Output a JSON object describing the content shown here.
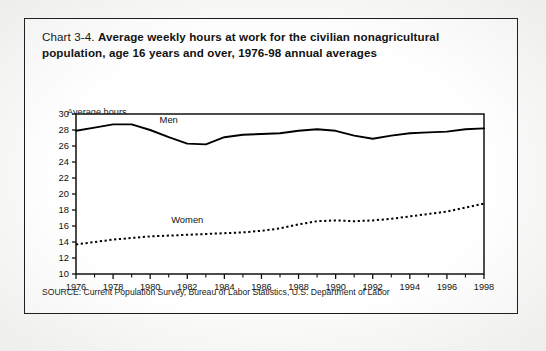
{
  "figure": {
    "chart_number": "Chart 3-4.",
    "title": "Average weekly hours at work for the civilian nonagricultural population, age 16 years and over, 1976-98 annual averages",
    "axis_note": "Average hours",
    "source": "SOURCE: Current Population Survey, Bureau of Labor Statistics, U.S. Department of Labor"
  },
  "chart_data": {
    "type": "line",
    "title": "Average weekly hours at work for the civilian nonagricultural population, age 16 years and over, 1976-98 annual averages",
    "xlabel": "",
    "ylabel": "Average hours",
    "ylim": [
      10,
      30
    ],
    "ytick_step": 2,
    "yticks": [
      10,
      12,
      14,
      16,
      18,
      20,
      22,
      24,
      26,
      28,
      30
    ],
    "xlim": [
      1976,
      1998
    ],
    "xticks": [
      1976,
      1978,
      1980,
      1982,
      1984,
      1986,
      1988,
      1990,
      1992,
      1994,
      1996,
      1998
    ],
    "minor_xticks": [
      1977,
      1979,
      1981,
      1983,
      1985,
      1987,
      1989,
      1991,
      1993,
      1995,
      1997
    ],
    "grid": false,
    "legend_position": "inline-labels",
    "x": [
      1976,
      1977,
      1978,
      1979,
      1980,
      1981,
      1982,
      1983,
      1984,
      1985,
      1986,
      1987,
      1988,
      1989,
      1990,
      1991,
      1992,
      1993,
      1994,
      1995,
      1996,
      1997,
      1998
    ],
    "series": [
      {
        "name": "Men",
        "style": "solid",
        "color": "#000000",
        "label_x": 1981,
        "label_y": 28.9,
        "values": [
          27.9,
          28.3,
          28.7,
          28.7,
          28.0,
          27.1,
          26.3,
          26.2,
          27.1,
          27.4,
          27.5,
          27.6,
          27.9,
          28.1,
          27.9,
          27.3,
          26.9,
          27.3,
          27.6,
          27.7,
          27.8,
          28.1,
          28.2
        ]
      },
      {
        "name": "Women",
        "style": "dotted",
        "color": "#000000",
        "label_x": 1982,
        "label_y": 16.4,
        "values": [
          13.7,
          14.0,
          14.3,
          14.5,
          14.7,
          14.8,
          14.9,
          15.0,
          15.1,
          15.2,
          15.4,
          15.7,
          16.2,
          16.6,
          16.7,
          16.6,
          16.7,
          16.9,
          17.2,
          17.5,
          17.8,
          18.3,
          18.8
        ]
      }
    ]
  }
}
